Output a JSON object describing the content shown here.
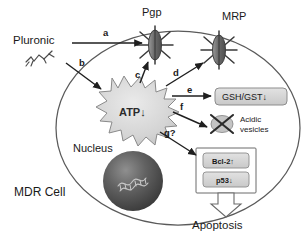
{
  "figure": {
    "cell_label": "MDR Cell",
    "background_color": "#ffffff",
    "line_color": "#4a4a4a"
  },
  "extracellular": {
    "pluronic_label": "Pluronic",
    "pluronic_icon": "polymer-chain-squiggle"
  },
  "transporters": [
    {
      "id": "pgp",
      "label": "Pgp",
      "icon": "crossed-out-transporter-icon",
      "state": "inhibited"
    },
    {
      "id": "mrp",
      "label": "MRP",
      "icon": "crossed-out-transporter-icon",
      "state": "inhibited"
    }
  ],
  "energy": {
    "label": "ATP↓",
    "shape": "starburst",
    "fill": "#d9d9d9"
  },
  "nucleus": {
    "label": "Nucleus",
    "icon": "dna-helix-icon",
    "fill": "#4f4f4f"
  },
  "arrows": [
    {
      "id": "a",
      "label": "a",
      "from": "Pluronic",
      "to": "Pgp"
    },
    {
      "id": "b",
      "label": "b",
      "from": "Pluronic",
      "to": "ATP"
    },
    {
      "id": "c",
      "label": "c",
      "from": "ATP",
      "to": "Pgp"
    },
    {
      "id": "d",
      "label": "d",
      "from": "ATP",
      "to": "MRP"
    },
    {
      "id": "e",
      "label": "e",
      "from": "ATP",
      "to": "GSH/GST"
    },
    {
      "id": "f",
      "label": "f",
      "from": "ATP",
      "to": "Acidic vesicles"
    },
    {
      "id": "g",
      "label": "g?",
      "from": "ATP",
      "to": "Bcl-2 / p53"
    }
  ],
  "targets": [
    {
      "id": "gsh-gst",
      "label": "GSH/GST↓",
      "type": "rounded-box",
      "fill": "#d6d6d6"
    },
    {
      "id": "acidic-vesicles",
      "label_line1": "Acidic",
      "label_line2": "vesicles",
      "icon": "crossed-out-vesicle-icon"
    }
  ],
  "apoptosis_panel": {
    "items": [
      {
        "id": "bcl2",
        "label": "Bcl-2↑"
      },
      {
        "id": "p53",
        "label": "p53↓"
      }
    ],
    "outcome_label": "Apoptosis",
    "outcome_arrow": "hollow-block-arrow-down"
  }
}
